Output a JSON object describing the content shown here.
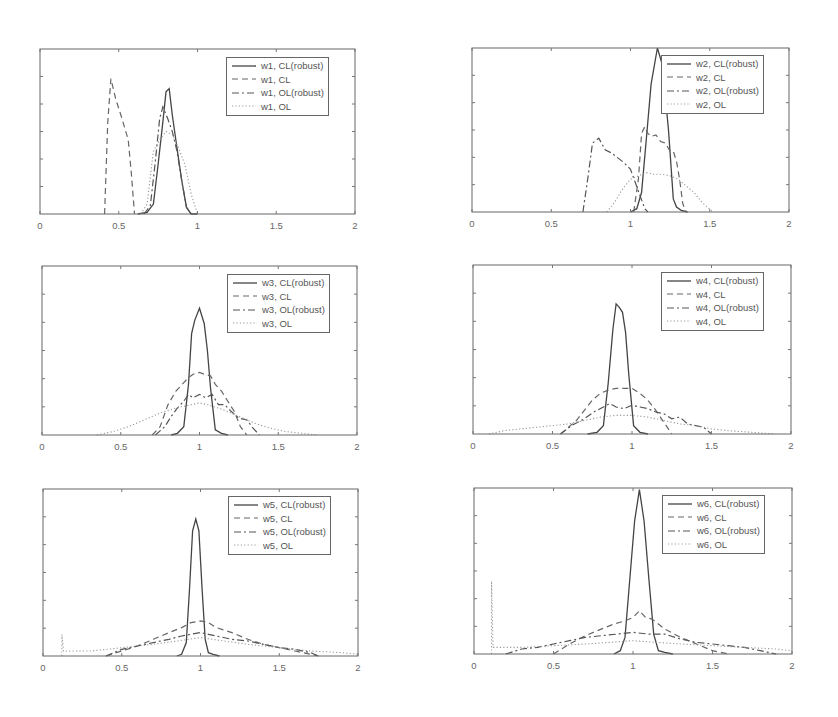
{
  "chart_data": [
    {
      "type": "line",
      "panel": "w1",
      "xlim": [
        0,
        2
      ],
      "ylim": [
        0,
        1
      ],
      "xticks": [
        "0",
        "0.5",
        "1",
        "1.5",
        "2"
      ],
      "xlabel": "",
      "ylabel": "",
      "title": "",
      "legend_position": "upper right",
      "series": [
        {
          "name": "w1, CL(robust)",
          "style": "solid",
          "x": [
            0.62,
            0.68,
            0.72,
            0.75,
            0.78,
            0.8,
            0.82,
            0.84,
            0.87,
            0.9,
            0.93,
            0.96,
            1.0
          ],
          "y": [
            0,
            0.01,
            0.06,
            0.3,
            0.56,
            0.74,
            0.76,
            0.6,
            0.4,
            0.2,
            0.04,
            0,
            0
          ]
        },
        {
          "name": "w1, CL",
          "style": "dashed",
          "x": [
            0.41,
            0.43,
            0.45,
            0.48,
            0.52,
            0.56,
            0.58,
            0.6
          ],
          "y": [
            0,
            0.55,
            0.82,
            0.7,
            0.58,
            0.45,
            0.25,
            0
          ]
        },
        {
          "name": "w1, OL(robust)",
          "style": "dashdot",
          "x": [
            0.66,
            0.7,
            0.73,
            0.76,
            0.78,
            0.81,
            0.84,
            0.87,
            0.9,
            0.93,
            0.96
          ],
          "y": [
            0,
            0.05,
            0.3,
            0.58,
            0.65,
            0.58,
            0.5,
            0.38,
            0.2,
            0.04,
            0
          ]
        },
        {
          "name": "w1, OL",
          "style": "dotted",
          "x": [
            0.64,
            0.68,
            0.72,
            0.76,
            0.8,
            0.84,
            0.88,
            0.92,
            0.96,
            1.0
          ],
          "y": [
            0,
            0.06,
            0.38,
            0.45,
            0.5,
            0.48,
            0.4,
            0.3,
            0.12,
            0
          ]
        }
      ]
    },
    {
      "type": "line",
      "panel": "w2",
      "xlim": [
        0,
        2
      ],
      "ylim": [
        0,
        1
      ],
      "xticks": [
        "0",
        "0.5",
        "1",
        "1.5",
        "2"
      ],
      "xlabel": "",
      "ylabel": "",
      "title": "",
      "legend_position": "upper right",
      "series": [
        {
          "name": "w2, CL(robust)",
          "style": "solid",
          "x": [
            1.0,
            1.04,
            1.07,
            1.1,
            1.13,
            1.17,
            1.2,
            1.24,
            1.27,
            1.29,
            1.32,
            1.36
          ],
          "y": [
            0,
            0.02,
            0.12,
            0.45,
            0.78,
            1.0,
            0.9,
            0.5,
            0.08,
            0.03,
            0.01,
            0
          ]
        },
        {
          "name": "w2, CL",
          "style": "dashed",
          "x": [
            1.02,
            1.05,
            1.07,
            1.09,
            1.11,
            1.13,
            1.16,
            1.19,
            1.22,
            1.25,
            1.27,
            1.29,
            1.31,
            1.33,
            1.35
          ],
          "y": [
            0,
            0.2,
            0.48,
            0.52,
            0.48,
            0.46,
            0.47,
            0.43,
            0.42,
            0.37,
            0.37,
            0.31,
            0.2,
            0.05,
            0
          ]
        },
        {
          "name": "w2, OL(robust)",
          "style": "dashdot",
          "x": [
            0.7,
            0.73,
            0.76,
            0.8,
            0.84,
            0.88,
            0.92,
            0.96,
            1.0,
            1.03,
            1.06,
            1.09,
            1.11
          ],
          "y": [
            0,
            0.2,
            0.42,
            0.45,
            0.38,
            0.36,
            0.33,
            0.3,
            0.26,
            0.18,
            0.1,
            0.02,
            0
          ]
        },
        {
          "name": "w2, OL",
          "style": "dotted",
          "x": [
            0.85,
            0.9,
            0.95,
            1.0,
            1.05,
            1.1,
            1.15,
            1.2,
            1.25,
            1.3,
            1.35,
            1.4,
            1.45,
            1.52
          ],
          "y": [
            0,
            0.06,
            0.14,
            0.2,
            0.22,
            0.24,
            0.23,
            0.23,
            0.22,
            0.2,
            0.16,
            0.12,
            0.06,
            0
          ]
        }
      ]
    },
    {
      "type": "line",
      "panel": "w3",
      "xlim": [
        0,
        2
      ],
      "ylim": [
        0,
        1
      ],
      "xticks": [
        "0",
        "0.5",
        "1",
        "1.5",
        "2"
      ],
      "xlabel": "",
      "ylabel": "",
      "title": "",
      "legend_position": "upper right",
      "series": [
        {
          "name": "w3, CL(robust)",
          "style": "solid",
          "x": [
            0.82,
            0.86,
            0.9,
            0.93,
            0.95,
            0.97,
            1.0,
            1.03,
            1.05,
            1.07,
            1.1,
            1.14,
            1.18
          ],
          "y": [
            0,
            0.01,
            0.05,
            0.3,
            0.6,
            0.68,
            0.75,
            0.66,
            0.5,
            0.28,
            0.03,
            0.01,
            0
          ]
        },
        {
          "name": "w3, CL",
          "style": "dashed",
          "x": [
            0.7,
            0.75,
            0.8,
            0.85,
            0.9,
            0.93,
            0.96,
            1.0,
            1.03,
            1.07,
            1.1,
            1.14,
            1.18,
            1.22,
            1.26,
            1.3
          ],
          "y": [
            0,
            0.05,
            0.18,
            0.26,
            0.31,
            0.34,
            0.36,
            0.37,
            0.36,
            0.35,
            0.3,
            0.26,
            0.2,
            0.14,
            0.05,
            0
          ]
        },
        {
          "name": "w3, OL(robust)",
          "style": "dashdot",
          "x": [
            0.72,
            0.78,
            0.82,
            0.86,
            0.9,
            0.93,
            0.96,
            1.0,
            1.04,
            1.08,
            1.12,
            1.16,
            1.2,
            1.25,
            1.3,
            1.34,
            1.38
          ],
          "y": [
            0,
            0.05,
            0.11,
            0.16,
            0.2,
            0.24,
            0.22,
            0.24,
            0.22,
            0.24,
            0.18,
            0.18,
            0.14,
            0.1,
            0.09,
            0.04,
            0
          ]
        },
        {
          "name": "w3, OL",
          "style": "dotted",
          "x": [
            0.35,
            0.45,
            0.55,
            0.65,
            0.75,
            0.85,
            0.95,
            1.0,
            1.05,
            1.15,
            1.25,
            1.35,
            1.45,
            1.55,
            1.65,
            1.75
          ],
          "y": [
            0,
            0.02,
            0.05,
            0.09,
            0.13,
            0.16,
            0.18,
            0.19,
            0.18,
            0.15,
            0.11,
            0.07,
            0.04,
            0.02,
            0.01,
            0
          ]
        }
      ]
    },
    {
      "type": "line",
      "panel": "w4",
      "xlim": [
        0,
        2
      ],
      "ylim": [
        0,
        1
      ],
      "xticks": [
        "0",
        "0.5",
        "1",
        "1.5",
        "2"
      ],
      "xlabel": "",
      "ylabel": "",
      "title": "",
      "legend_position": "upper right",
      "series": [
        {
          "name": "w4, CL(robust)",
          "style": "solid",
          "x": [
            0.72,
            0.78,
            0.82,
            0.85,
            0.88,
            0.9,
            0.92,
            0.94,
            0.96,
            0.98,
            1.01,
            1.05,
            1.1
          ],
          "y": [
            0,
            0.01,
            0.05,
            0.3,
            0.62,
            0.77,
            0.75,
            0.72,
            0.6,
            0.35,
            0.05,
            0.01,
            0
          ]
        },
        {
          "name": "w4, CL",
          "style": "dashed",
          "x": [
            0.55,
            0.6,
            0.65,
            0.7,
            0.75,
            0.8,
            0.85,
            0.9,
            0.95,
            1.0,
            1.05,
            1.1,
            1.15,
            1.2,
            1.25
          ],
          "y": [
            0,
            0.04,
            0.08,
            0.14,
            0.2,
            0.24,
            0.26,
            0.27,
            0.27,
            0.27,
            0.24,
            0.2,
            0.14,
            0.07,
            0
          ]
        },
        {
          "name": "w4, OL(robust)",
          "style": "dashdot",
          "x": [
            0.55,
            0.62,
            0.7,
            0.76,
            0.82,
            0.86,
            0.9,
            0.95,
            1.0,
            1.05,
            1.1,
            1.15,
            1.2,
            1.25,
            1.3,
            1.35,
            1.4,
            1.45,
            1.5
          ],
          "y": [
            0,
            0.05,
            0.09,
            0.13,
            0.16,
            0.18,
            0.16,
            0.15,
            0.17,
            0.16,
            0.15,
            0.13,
            0.12,
            0.09,
            0.1,
            0.06,
            0.05,
            0.04,
            0
          ]
        },
        {
          "name": "w4, OL",
          "style": "dotted",
          "x": [
            0.1,
            0.2,
            0.3,
            0.4,
            0.5,
            0.6,
            0.7,
            0.8,
            0.9,
            1.0,
            1.1,
            1.2,
            1.3,
            1.4,
            1.5,
            1.6,
            1.75,
            1.9
          ],
          "y": [
            0,
            0.02,
            0.03,
            0.04,
            0.05,
            0.06,
            0.08,
            0.1,
            0.11,
            0.11,
            0.1,
            0.08,
            0.06,
            0.05,
            0.03,
            0.02,
            0.01,
            0
          ]
        }
      ]
    },
    {
      "type": "line",
      "panel": "w5",
      "xlim": [
        0,
        2
      ],
      "ylim": [
        0,
        1
      ],
      "xticks": [
        "0",
        "0.5",
        "1",
        "1.5",
        "2"
      ],
      "xlabel": "",
      "ylabel": "",
      "title": "",
      "legend_position": "upper right",
      "series": [
        {
          "name": "w5, CL(robust)",
          "style": "solid",
          "x": [
            0.85,
            0.88,
            0.91,
            0.93,
            0.95,
            0.97,
            0.99,
            1.01,
            1.03,
            1.05,
            1.08,
            1.12
          ],
          "y": [
            0,
            0.01,
            0.08,
            0.4,
            0.75,
            0.82,
            0.75,
            0.4,
            0.1,
            0.02,
            0.01,
            0
          ]
        },
        {
          "name": "w5, CL",
          "style": "dashed",
          "x": [
            0.4,
            0.5,
            0.6,
            0.7,
            0.8,
            0.88,
            0.94,
            1.0,
            1.05,
            1.1,
            1.2,
            1.3,
            1.4,
            1.5,
            1.6,
            1.7,
            1.75
          ],
          "y": [
            0,
            0.03,
            0.06,
            0.1,
            0.14,
            0.17,
            0.2,
            0.21,
            0.2,
            0.17,
            0.14,
            0.1,
            0.07,
            0.05,
            0.03,
            0.01,
            0
          ]
        },
        {
          "name": "w5, OL(robust)",
          "style": "dashdot",
          "x": [
            0.4,
            0.5,
            0.6,
            0.7,
            0.8,
            0.88,
            0.94,
            1.0,
            1.05,
            1.1,
            1.2,
            1.3,
            1.4,
            1.5,
            1.6,
            1.7,
            1.75
          ],
          "y": [
            0,
            0.04,
            0.06,
            0.08,
            0.1,
            0.12,
            0.13,
            0.14,
            0.13,
            0.12,
            0.1,
            0.09,
            0.07,
            0.05,
            0.04,
            0.02,
            0
          ]
        },
        {
          "name": "w5, OL",
          "style": "dotted",
          "x": [
            0.12,
            0.12,
            0.13,
            0.3,
            0.5,
            0.7,
            0.85,
            1.0,
            1.15,
            1.3,
            1.5,
            1.7,
            1.9,
            2.0
          ],
          "y": [
            0,
            0.13,
            0.03,
            0.03,
            0.05,
            0.07,
            0.09,
            0.11,
            0.09,
            0.07,
            0.05,
            0.03,
            0.02,
            0.01
          ]
        }
      ]
    },
    {
      "type": "line",
      "panel": "w6",
      "xlim": [
        0,
        2
      ],
      "ylim": [
        0,
        1
      ],
      "xticks": [
        "0",
        "0.5",
        "1",
        "1.5",
        "2"
      ],
      "xlabel": "",
      "ylabel": "",
      "title": "",
      "legend_position": "upper right",
      "series": [
        {
          "name": "w6, CL(robust)",
          "style": "solid",
          "x": [
            0.88,
            0.92,
            0.95,
            0.98,
            1.01,
            1.04,
            1.07,
            1.1,
            1.13,
            1.16,
            1.2,
            1.25
          ],
          "y": [
            0,
            0.02,
            0.1,
            0.45,
            0.8,
            0.99,
            0.8,
            0.45,
            0.12,
            0.02,
            0.01,
            0
          ]
        },
        {
          "name": "w6, CL",
          "style": "dashed",
          "x": [
            0.5,
            0.6,
            0.7,
            0.8,
            0.88,
            0.95,
            1.0,
            1.04,
            1.08,
            1.12,
            1.2,
            1.3,
            1.4,
            1.5,
            1.6
          ],
          "y": [
            0,
            0.06,
            0.11,
            0.15,
            0.18,
            0.2,
            0.22,
            0.26,
            0.22,
            0.21,
            0.15,
            0.1,
            0.06,
            0.02,
            0
          ]
        },
        {
          "name": "w6, OL(robust)",
          "style": "dashdot",
          "x": [
            0.2,
            0.3,
            0.4,
            0.5,
            0.6,
            0.7,
            0.8,
            0.9,
            1.0,
            1.1,
            1.2,
            1.3,
            1.4,
            1.5,
            1.6,
            1.7,
            1.8,
            1.9
          ],
          "y": [
            0,
            0.03,
            0.04,
            0.06,
            0.08,
            0.1,
            0.11,
            0.12,
            0.13,
            0.12,
            0.12,
            0.09,
            0.07,
            0.06,
            0.05,
            0.04,
            0.02,
            0
          ]
        },
        {
          "name": "w6, OL",
          "style": "dotted",
          "x": [
            0.11,
            0.11,
            0.12,
            0.3,
            0.5,
            0.7,
            0.85,
            1.0,
            1.15,
            1.3,
            1.5,
            1.7,
            1.9,
            2.0
          ],
          "y": [
            0,
            0.44,
            0.04,
            0.04,
            0.05,
            0.06,
            0.07,
            0.08,
            0.07,
            0.06,
            0.05,
            0.04,
            0.03,
            0.02
          ]
        }
      ]
    }
  ],
  "panels": [
    {
      "id": "w1",
      "box": [
        40,
        49,
        315,
        165
      ],
      "legend": [
        226,
        57
      ]
    },
    {
      "id": "w2",
      "box": [
        472,
        48,
        317,
        164
      ],
      "legend": [
        661,
        55
      ]
    },
    {
      "id": "w3",
      "box": [
        42,
        266,
        315,
        169
      ],
      "legend": [
        227,
        274
      ]
    },
    {
      "id": "w4",
      "box": [
        473,
        265,
        318,
        169
      ],
      "legend": [
        661,
        272
      ]
    },
    {
      "id": "w5",
      "box": [
        43,
        489,
        315,
        167
      ],
      "legend": [
        228,
        496
      ]
    },
    {
      "id": "w6",
      "box": [
        474,
        488,
        318,
        166
      ],
      "legend": [
        662,
        495
      ]
    }
  ]
}
